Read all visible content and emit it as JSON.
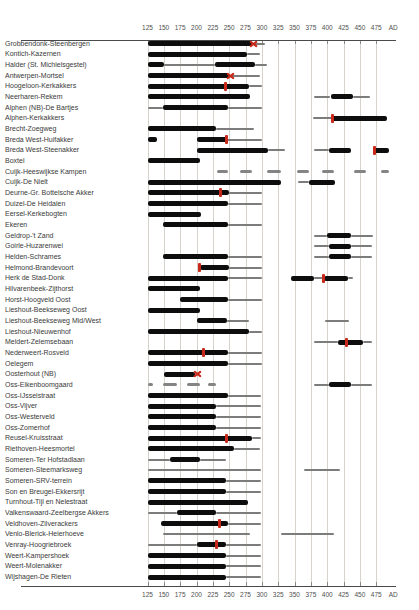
{
  "chart_data": {
    "type": "bar",
    "subtype": "horizontal-date-range-timeline",
    "title": "",
    "xlabel": "AD",
    "ylabel": "",
    "x_unit_suffix": "AD",
    "xlim": [
      125,
      500
    ],
    "ticks": [
      125,
      150,
      175,
      200,
      225,
      250,
      275,
      300,
      325,
      350,
      375,
      400,
      425,
      450,
      475
    ],
    "grid": true,
    "axis_on_top_and_bottom": true,
    "colors": {
      "thick_bar": "#0d0d0d",
      "thin_bar": "#7c7c7c",
      "dash_bar": "#848484",
      "marker_red": "#c8291a",
      "gridline": "#d7d2cb",
      "axis_text": "#4f4f4f",
      "label_text": "#3a3a3a"
    },
    "legend_semantics": {
      "thick": "well-attested occupation period",
      "thin": "uncertain/possible occupation period",
      "dash": "intermittent evidence",
      "marker_x": "red x marker (event date)",
      "marker_tick": "red tick marker (event date)"
    },
    "rows": [
      {
        "label": "Grobbendonk-Steenbergen",
        "segments": [
          [
            "thick",
            125,
            285
          ],
          [
            "thin",
            285,
            305
          ]
        ],
        "markers": [
          {
            "type": "x",
            "year": 287
          }
        ]
      },
      {
        "label": "Kontich-Kazernen",
        "segments": [
          [
            "thick",
            125,
            277
          ],
          [
            "thin",
            277,
            297
          ]
        ],
        "markers": []
      },
      {
        "label": "Halder (St. Michielsgestel)",
        "segments": [
          [
            "thick",
            125,
            150
          ],
          [
            "thin",
            150,
            228
          ],
          [
            "thick",
            228,
            290
          ],
          [
            "thin",
            290,
            308
          ]
        ],
        "markers": []
      },
      {
        "label": "Antwerpen-Mortsel",
        "segments": [
          [
            "thick",
            125,
            250
          ],
          [
            "thin",
            250,
            297
          ]
        ],
        "markers": [
          {
            "type": "x",
            "year": 252
          }
        ]
      },
      {
        "label": "Hoogeloon-Kerkakkers",
        "segments": [
          [
            "thick",
            125,
            280
          ],
          [
            "thin",
            280,
            300
          ]
        ],
        "markers": [
          {
            "type": "tick",
            "year": 245
          }
        ]
      },
      {
        "label": "Neerharen-Rekem",
        "segments": [
          [
            "thick",
            125,
            282
          ],
          [
            "thin",
            380,
            405
          ],
          [
            "thick",
            405,
            440
          ],
          [
            "thin",
            440,
            465
          ]
        ],
        "markers": []
      },
      {
        "label": "Alphen (NB)-De Bartjes",
        "segments": [
          [
            "thin",
            125,
            148
          ],
          [
            "thick",
            148,
            248
          ],
          [
            "thin",
            248,
            300
          ]
        ],
        "markers": []
      },
      {
        "label": "Alphen-Kerkakkers",
        "segments": [
          [
            "thin",
            378,
            408
          ],
          [
            "thick",
            408,
            492
          ]
        ],
        "markers": [
          {
            "type": "tick",
            "year": 408
          }
        ]
      },
      {
        "label": "Brecht-Zoegweg",
        "segments": [
          [
            "thick",
            125,
            230
          ],
          [
            "thin",
            230,
            288
          ]
        ],
        "markers": []
      },
      {
        "label": "Breda West-Huifakker",
        "segments": [
          [
            "thick",
            125,
            140
          ],
          [
            "thick",
            200,
            246
          ],
          [
            "thin",
            246,
            300
          ]
        ],
        "markers": [
          {
            "type": "tick",
            "year": 246
          }
        ]
      },
      {
        "label": "Breda West-Steenakker",
        "segments": [
          [
            "thick",
            200,
            310
          ],
          [
            "thin",
            310,
            335
          ],
          [
            "thin",
            380,
            402
          ],
          [
            "thick",
            402,
            436
          ],
          [
            "thick",
            472,
            495
          ]
        ],
        "markers": [
          {
            "type": "tick",
            "year": 472
          }
        ]
      },
      {
        "label": "Boxtel",
        "segments": [
          [
            "thick",
            125,
            205
          ]
        ],
        "markers": []
      },
      {
        "label": "Cuijk-Heeswijkse Kampen",
        "segments": [
          [
            "dash",
            231,
            248
          ],
          [
            "dash",
            267,
            285
          ],
          [
            "dash",
            308,
            330
          ],
          [
            "dash",
            354,
            372
          ],
          [
            "dash",
            392,
            410
          ],
          [
            "dash",
            441,
            459
          ],
          [
            "dash",
            482,
            494
          ]
        ],
        "markers": []
      },
      {
        "label": "Cuijk-De Nielt",
        "segments": [
          [
            "thick",
            125,
            330
          ],
          [
            "thin",
            355,
            372
          ],
          [
            "thick",
            372,
            412
          ]
        ],
        "markers": []
      },
      {
        "label": "Deurne-Gr. Bottelsche Akker",
        "segments": [
          [
            "thick",
            125,
            250
          ],
          [
            "thin",
            250,
            300
          ]
        ],
        "markers": [
          {
            "type": "tick",
            "year": 237
          }
        ]
      },
      {
        "label": "Duizel-De Heidalen",
        "segments": [
          [
            "thick",
            125,
            248
          ],
          [
            "thin",
            248,
            300
          ]
        ],
        "markers": []
      },
      {
        "label": "Eersel-Kerkebogten",
        "segments": [
          [
            "thick",
            125,
            207
          ]
        ],
        "markers": []
      },
      {
        "label": "Ekeren",
        "segments": [
          [
            "thick",
            148,
            248
          ],
          [
            "thin",
            248,
            300
          ]
        ],
        "markers": []
      },
      {
        "label": "Geldrop-'t Zand",
        "segments": [
          [
            "thin",
            380,
            400
          ],
          [
            "thick",
            400,
            436
          ],
          [
            "thin",
            436,
            470
          ]
        ],
        "markers": []
      },
      {
        "label": "Goirle-Huzarenwei",
        "segments": [
          [
            "thin",
            380,
            402
          ],
          [
            "thick",
            402,
            437
          ],
          [
            "thin",
            437,
            468
          ]
        ],
        "markers": []
      },
      {
        "label": "Helden-Schrames",
        "segments": [
          [
            "thick",
            148,
            248
          ],
          [
            "thin",
            248,
            300
          ],
          [
            "thin",
            380,
            402
          ],
          [
            "thick",
            402,
            437
          ],
          [
            "thin",
            437,
            468
          ]
        ],
        "markers": []
      },
      {
        "label": "Helmond-Brandevoort",
        "segments": [
          [
            "thick",
            205,
            250
          ],
          [
            "thin",
            250,
            300
          ]
        ],
        "markers": [
          {
            "type": "tick",
            "year": 205
          }
        ]
      },
      {
        "label": "Herk de Stad-Donk",
        "segments": [
          [
            "thick",
            125,
            248
          ],
          [
            "thin",
            248,
            300
          ],
          [
            "thick",
            345,
            380
          ],
          [
            "thin",
            380,
            395
          ],
          [
            "thick",
            395,
            432
          ],
          [
            "thin",
            432,
            440
          ]
        ],
        "markers": [
          {
            "type": "tick",
            "year": 395
          }
        ]
      },
      {
        "label": "Hilvarenbeek-Zijthorst",
        "segments": [
          [
            "thick",
            125,
            205
          ]
        ],
        "markers": []
      },
      {
        "label": "Horst-Hoogveld Oost",
        "segments": [
          [
            "thick",
            175,
            248
          ],
          [
            "thin",
            248,
            300
          ]
        ],
        "markers": []
      },
      {
        "label": "Lieshout-Beekseweg Oost",
        "segments": [
          [
            "thick",
            125,
            205
          ]
        ],
        "markers": []
      },
      {
        "label": "Lieshout-Beekseweg Mid/West",
        "segments": [
          [
            "thick",
            200,
            246
          ],
          [
            "thin",
            246,
            280
          ],
          [
            "thin",
            397,
            433
          ]
        ],
        "markers": []
      },
      {
        "label": "Lieshout-Nieuwenhof",
        "segments": [
          [
            "thick",
            125,
            280
          ],
          [
            "thin",
            280,
            300
          ]
        ],
        "markers": []
      },
      {
        "label": "Meldert-Zelemsebaan",
        "segments": [
          [
            "thin",
            380,
            416
          ],
          [
            "thick",
            416,
            455
          ],
          [
            "thin",
            455,
            468
          ]
        ],
        "markers": [
          {
            "type": "tick",
            "year": 430
          }
        ]
      },
      {
        "label": "Nederweert-Rosveld",
        "segments": [
          [
            "thick",
            125,
            248
          ],
          [
            "thin",
            248,
            300
          ]
        ],
        "markers": [
          {
            "type": "tick",
            "year": 210
          }
        ]
      },
      {
        "label": "Oelegem",
        "segments": [
          [
            "thick",
            125,
            248
          ],
          [
            "thin",
            248,
            300
          ]
        ],
        "markers": []
      },
      {
        "label": "Oosterhout (NB)",
        "segments": [
          [
            "thick",
            150,
            198
          ]
        ],
        "markers": [
          {
            "type": "x",
            "year": 202
          }
        ]
      },
      {
        "label": "Oss-Eikenboomgaard",
        "segments": [
          [
            "dash",
            125,
            133
          ],
          [
            "dash",
            148,
            170
          ],
          [
            "dash",
            185,
            205
          ],
          [
            "dash",
            218,
            230
          ],
          [
            "thin",
            380,
            402
          ],
          [
            "thick",
            402,
            437
          ],
          [
            "thin",
            437,
            468
          ]
        ],
        "markers": []
      },
      {
        "label": "Oss-IJsselstraat",
        "segments": [
          [
            "thick",
            125,
            248
          ],
          [
            "thin",
            248,
            298
          ]
        ],
        "markers": []
      },
      {
        "label": "Oss-Vijver",
        "segments": [
          [
            "thick",
            125,
            230
          ],
          [
            "thin",
            230,
            298
          ]
        ],
        "markers": []
      },
      {
        "label": "Oss-Westerveld",
        "segments": [
          [
            "thick",
            125,
            230
          ],
          [
            "thin",
            230,
            298
          ]
        ],
        "markers": []
      },
      {
        "label": "Oss-Zomerhof",
        "segments": [
          [
            "thick",
            125,
            230
          ],
          [
            "thin",
            230,
            298
          ]
        ],
        "markers": []
      },
      {
        "label": "Reusel-Kruisstraat",
        "segments": [
          [
            "thick",
            125,
            285
          ],
          [
            "thin",
            285,
            298
          ]
        ],
        "markers": [
          {
            "type": "tick",
            "year": 246
          }
        ]
      },
      {
        "label": "Riethoven-Heesmortel",
        "segments": [
          [
            "thick",
            125,
            257
          ],
          [
            "thin",
            257,
            297
          ]
        ],
        "markers": []
      },
      {
        "label": "Someren-Ter Hofstadlaan",
        "segments": [
          [
            "thin",
            125,
            160
          ],
          [
            "thick",
            160,
            205
          ],
          [
            "thin",
            205,
            245
          ]
        ],
        "markers": []
      },
      {
        "label": "Someren-Steemarksweg",
        "segments": [
          [
            "thin",
            125,
            298
          ],
          [
            "thin",
            365,
            420
          ]
        ],
        "markers": []
      },
      {
        "label": "Someren-SRV-terrein",
        "segments": [
          [
            "thick",
            125,
            245
          ],
          [
            "thin",
            245,
            298
          ]
        ],
        "markers": []
      },
      {
        "label": "Son en Breugel-Ekkersrijt",
        "segments": [
          [
            "thick",
            125,
            245
          ],
          [
            "thin",
            245,
            298
          ]
        ],
        "markers": []
      },
      {
        "label": "Turnhout-Tijl en Nelestraat",
        "segments": [
          [
            "thick",
            125,
            278
          ]
        ],
        "markers": []
      },
      {
        "label": "Valkenswaard-Zeelbergse Akkers",
        "segments": [
          [
            "thin",
            125,
            170
          ],
          [
            "thick",
            170,
            230
          ],
          [
            "thin",
            230,
            298
          ]
        ],
        "markers": []
      },
      {
        "label": "Veldhoven-Zilverackers",
        "segments": [
          [
            "thick",
            145,
            248
          ],
          [
            "thin",
            248,
            298
          ]
        ],
        "markers": [
          {
            "type": "tick",
            "year": 235
          }
        ]
      },
      {
        "label": "Venlo-Blerick-Heierhoeve",
        "segments": [
          [
            "thin",
            148,
            282
          ],
          [
            "thin",
            330,
            410
          ]
        ],
        "markers": []
      },
      {
        "label": "Venray-Hoogriebroek",
        "segments": [
          [
            "thin",
            125,
            200
          ],
          [
            "thick",
            200,
            245
          ],
          [
            "thin",
            245,
            298
          ]
        ],
        "markers": [
          {
            "type": "tick",
            "year": 230
          }
        ]
      },
      {
        "label": "Weert-Kampershoek",
        "segments": [
          [
            "thick",
            125,
            245
          ],
          [
            "thin",
            245,
            298
          ]
        ],
        "markers": []
      },
      {
        "label": "Weert-Molenakker",
        "segments": [
          [
            "thick",
            125,
            245
          ],
          [
            "thin",
            245,
            298
          ]
        ],
        "markers": []
      },
      {
        "label": "Wijshagen-De Rieten",
        "segments": [
          [
            "thick",
            125,
            245
          ],
          [
            "thin",
            245,
            298
          ]
        ],
        "markers": []
      }
    ]
  }
}
